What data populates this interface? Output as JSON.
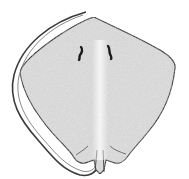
{
  "image": {
    "subject": "skate ray dorsal view illustration",
    "caption_cropped": "",
    "colors": {
      "background": "#ffffff",
      "body_fill": "#dedede",
      "outline": "#3a3a3a",
      "midline": "#f2f2f2",
      "eyes": "#1a1a1a"
    }
  }
}
